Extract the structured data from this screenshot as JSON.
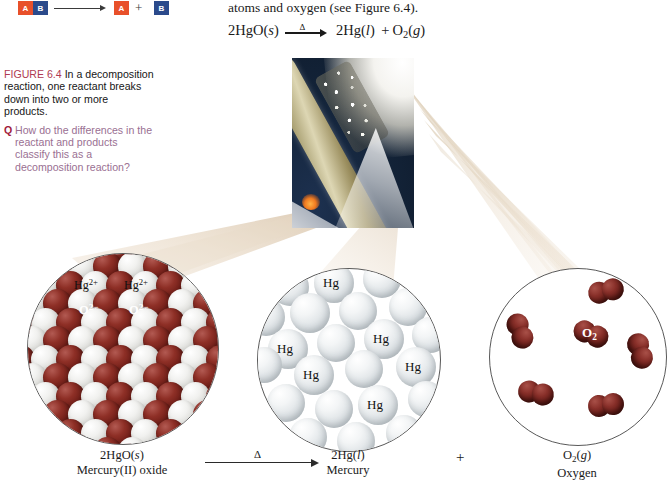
{
  "schematic": {
    "reactant_a": "A",
    "reactant_b": "B",
    "product_a": "A",
    "product_b": "B",
    "plus": "+",
    "color_a": "#e8502a",
    "color_b": "#2b4a8b"
  },
  "intro": {
    "text": "atoms and oxygen (see Figure 6.4)."
  },
  "equation": {
    "reactant": "2HgO(",
    "reactant_state": "s",
    "reactant_close": ")",
    "condition": "Δ",
    "product1": "2Hg(",
    "product1_state": "l",
    "product1_close": ")",
    "plus": "+",
    "product2": "O",
    "product2_sub": "2",
    "product2_open": "(",
    "product2_state": "g",
    "product2_close": ")"
  },
  "caption": {
    "lead": "FIGURE 6.4",
    "body": "In a decomposition reaction, one reactant breaks down into two or more products.",
    "q_mark": "Q",
    "q_text": "How do the differences in the reactant and products classify this as a decomposition reaction?",
    "lead_color": "#b03a52",
    "q_color": "#9a6f92",
    "q_mark_color": "#a01b3c"
  },
  "photo": {
    "alt_name": "heated-test-tube-mercury-oxide",
    "background_color": "#16273f"
  },
  "circles": {
    "hgo": {
      "name": "mercury-oxide-lattice",
      "labels": [
        {
          "text": "Hg",
          "sup": "2+",
          "x": 46,
          "y": 23,
          "style": "dark"
        },
        {
          "text": "Hg",
          "sup": "2+",
          "x": 96,
          "y": 23,
          "style": "dark"
        },
        {
          "text": "O",
          "sup": "2−",
          "x": 51,
          "y": 48,
          "style": "light"
        },
        {
          "text": "O",
          "sup": "2−",
          "x": 101,
          "y": 48,
          "style": "light"
        }
      ]
    },
    "hg": {
      "name": "liquid-mercury-atoms",
      "labels": [
        "Hg",
        "Hg",
        "Hg",
        "Hg",
        "Hg",
        "Hg"
      ]
    },
    "o2": {
      "name": "oxygen-molecules",
      "label": "O",
      "label_sub": "2",
      "molecule_count": 6
    }
  },
  "bottom": {
    "reactant_formula": "2HgO(",
    "reactant_formula_state": "s",
    "reactant_formula_close": ")",
    "reactant_name": "Mercury(II) oxide",
    "condition": "Δ",
    "product1_formula": "2Hg(",
    "product1_formula_state": "l",
    "product1_formula_close": ")",
    "product1_name": "Mercury",
    "plus": "+",
    "product2_formula": "O",
    "product2_formula_sub": "2",
    "product2_formula_open": "(",
    "product2_formula_state": "g",
    "product2_formula_close": ")",
    "product2_name": "Oxygen"
  }
}
